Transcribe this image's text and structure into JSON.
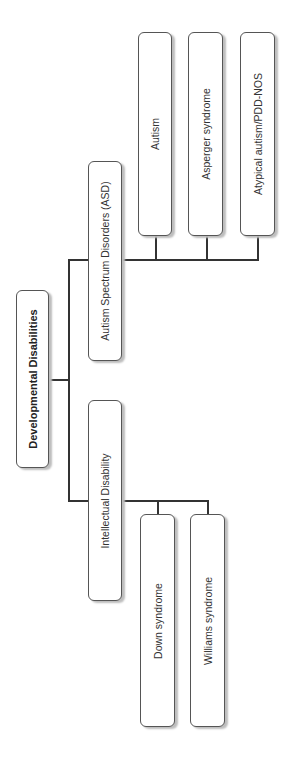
{
  "diagram": {
    "type": "tree",
    "orientation": "rotated-90-ccw",
    "root": {
      "label": "Developmental Disabilities"
    },
    "branches": [
      {
        "label": "Autism Spectrum Disorders (ASD)",
        "children": [
          {
            "label": "Autism"
          },
          {
            "label": "Asperger syndrome"
          },
          {
            "label": "Atypical autism/PDD-NOS"
          }
        ]
      },
      {
        "label": "Intellectual Disability",
        "children": [
          {
            "label": "Down syndrome"
          },
          {
            "label": "Williams syndrome"
          }
        ]
      }
    ]
  },
  "colors": {
    "border": "#555555",
    "line": "#333333",
    "shadow": "#bdbdbd",
    "background": "#ffffff"
  }
}
